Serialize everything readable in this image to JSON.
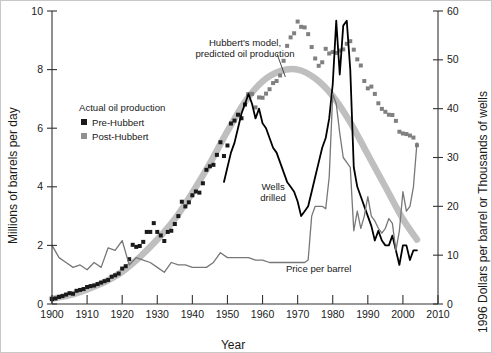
{
  "chart_data": {
    "type": "line",
    "title": "",
    "xlabel": "Year",
    "ylabel": "Millions of barrels per day",
    "y2label": "1996 Dollars per barrel or Thousands of wells",
    "xlim": [
      1900,
      2010
    ],
    "ylim": [
      0,
      10
    ],
    "y2lim": [
      0,
      60
    ],
    "xticks": [
      1900,
      1910,
      1920,
      1930,
      1940,
      1950,
      1960,
      1970,
      1980,
      1990,
      2000,
      2010
    ],
    "xticklabels": [
      "1900",
      "1910",
      "1920",
      "1930",
      "1940",
      "1950",
      "1960",
      "1970",
      "1980",
      "1990",
      "2000",
      "2010"
    ],
    "yticks": [
      0,
      2,
      4,
      6,
      8,
      10
    ],
    "yticklabels": [
      "0",
      "2",
      "4",
      "6",
      "8",
      "10"
    ],
    "y2ticks": [
      0,
      10,
      20,
      30,
      40,
      50,
      60
    ],
    "y2ticklabels": [
      "0",
      "10",
      "20",
      "30",
      "40",
      "50",
      "60"
    ],
    "grid": false,
    "legend_position": "upper-left-inside",
    "colors": {
      "pre_hubbert": "#1a1a1a",
      "post_hubbert": "#808080",
      "hubbert_model": "#bfbfbf",
      "wells_drilled": "#000000",
      "price_per_barrel": "#777777"
    },
    "annotations": [
      {
        "name": "hubbert-model-annotation",
        "text_line1": "Hubbert's model,",
        "text_line2": "predicted oil production",
        "x": 1955,
        "y": 8.8
      },
      {
        "name": "wells-drilled-annotation",
        "text_line1": "Wells",
        "text_line2": "drilled",
        "x": 1963,
        "y": 3.9
      },
      {
        "name": "price-per-barrel-annotation",
        "text_line1": "Price per barrel",
        "x": 1976,
        "y": 1.1
      }
    ],
    "series": [
      {
        "name": "Hubbert's model, predicted oil production",
        "key": "hubbert_model",
        "style": "thick-gray-curve",
        "axis": "left",
        "x": [
          1900,
          1905,
          1910,
          1915,
          1920,
          1925,
          1930,
          1935,
          1940,
          1945,
          1950,
          1955,
          1960,
          1965,
          1970,
          1975,
          1980,
          1985,
          1990,
          1995,
          2000,
          2004
        ],
        "values": [
          0.18,
          0.3,
          0.5,
          0.75,
          1.1,
          1.6,
          2.2,
          2.9,
          3.8,
          4.8,
          5.9,
          6.9,
          7.6,
          7.95,
          8.0,
          7.7,
          7.1,
          6.2,
          5.1,
          4.0,
          2.9,
          2.2
        ]
      },
      {
        "name": "Pre-Hubbert",
        "key": "pre_hubbert",
        "style": "black-squares",
        "axis": "left",
        "x": [
          1900,
          1901,
          1902,
          1903,
          1904,
          1905,
          1906,
          1907,
          1908,
          1909,
          1910,
          1911,
          1912,
          1913,
          1914,
          1915,
          1916,
          1917,
          1918,
          1919,
          1920,
          1921,
          1922,
          1923,
          1924,
          1925,
          1926,
          1927,
          1928,
          1929,
          1930,
          1931,
          1932,
          1933,
          1934,
          1935,
          1936,
          1937,
          1938,
          1939,
          1940,
          1941,
          1942,
          1943,
          1944,
          1945,
          1946,
          1947,
          1948,
          1949,
          1950,
          1951,
          1952,
          1953,
          1954,
          1955,
          1956
        ],
        "values": [
          0.17,
          0.19,
          0.24,
          0.27,
          0.32,
          0.37,
          0.35,
          0.45,
          0.48,
          0.51,
          0.58,
          0.61,
          0.63,
          0.68,
          0.73,
          0.78,
          0.82,
          0.93,
          0.98,
          1.04,
          1.21,
          1.29,
          1.53,
          2.02,
          1.95,
          1.98,
          2.12,
          2.46,
          2.46,
          2.76,
          2.46,
          2.34,
          2.15,
          2.46,
          2.5,
          2.73,
          3.0,
          3.49,
          3.33,
          3.47,
          3.71,
          3.84,
          3.8,
          4.12,
          4.58,
          4.7,
          4.75,
          5.09,
          5.52,
          5.05,
          5.41,
          6.16,
          6.26,
          6.46,
          6.34,
          6.81,
          7.15
        ]
      },
      {
        "name": "Post-Hubbert",
        "key": "post_hubbert",
        "style": "gray-squares",
        "axis": "left",
        "x": [
          1956,
          1957,
          1958,
          1959,
          1960,
          1961,
          1962,
          1963,
          1964,
          1965,
          1966,
          1967,
          1968,
          1969,
          1970,
          1971,
          1972,
          1973,
          1974,
          1975,
          1976,
          1977,
          1978,
          1979,
          1980,
          1981,
          1982,
          1983,
          1984,
          1985,
          1986,
          1987,
          1988,
          1989,
          1990,
          1991,
          1992,
          1993,
          1994,
          1995,
          1996,
          1997,
          1998,
          1999,
          2000,
          2001,
          2002,
          2003,
          2004
        ],
        "values": [
          7.15,
          7.17,
          6.71,
          7.05,
          7.04,
          7.18,
          7.33,
          7.54,
          7.61,
          7.8,
          8.3,
          8.81,
          9.1,
          9.24,
          9.64,
          9.46,
          9.44,
          9.21,
          8.77,
          8.38,
          8.13,
          8.25,
          8.71,
          8.55,
          8.6,
          8.57,
          8.65,
          8.69,
          8.88,
          8.97,
          8.68,
          8.35,
          8.14,
          7.61,
          7.36,
          7.42,
          7.17,
          6.85,
          6.66,
          6.56,
          6.46,
          6.45,
          6.25,
          5.88,
          5.82,
          5.8,
          5.75,
          5.68,
          5.42
        ]
      },
      {
        "name": "Wells drilled",
        "key": "wells_drilled",
        "style": "black-line",
        "axis": "right",
        "x": [
          1949,
          1950,
          1951,
          1952,
          1953,
          1954,
          1955,
          1956,
          1957,
          1958,
          1959,
          1960,
          1961,
          1962,
          1963,
          1964,
          1965,
          1966,
          1967,
          1968,
          1969,
          1970,
          1971,
          1972,
          1973,
          1974,
          1975,
          1976,
          1977,
          1978,
          1979,
          1980,
          1981,
          1982,
          1983,
          1984,
          1985,
          1986,
          1987,
          1988,
          1989,
          1990,
          1991,
          1992,
          1993,
          1994,
          1995,
          1996,
          1997,
          1998,
          1999,
          2000,
          2001,
          2002,
          2003,
          2004
        ],
        "values": [
          25,
          28,
          31,
          33,
          36,
          39,
          41,
          43,
          41,
          38,
          40,
          37,
          36,
          34,
          32,
          31,
          29,
          27,
          25,
          24,
          23,
          21,
          18,
          19,
          20,
          23,
          26,
          29,
          32,
          34,
          38,
          45,
          58,
          47,
          57,
          58,
          48,
          28,
          24,
          22,
          20,
          18,
          16,
          13,
          15,
          13,
          12,
          12,
          14,
          11,
          8,
          12,
          12,
          9,
          11,
          11
        ]
      },
      {
        "name": "Price per barrel",
        "key": "price_per_barrel",
        "style": "gray-thin-line",
        "axis": "right",
        "x": [
          1900,
          1902,
          1904,
          1906,
          1908,
          1910,
          1912,
          1914,
          1916,
          1918,
          1920,
          1922,
          1924,
          1926,
          1928,
          1930,
          1932,
          1934,
          1936,
          1938,
          1940,
          1942,
          1944,
          1946,
          1948,
          1950,
          1952,
          1954,
          1956,
          1958,
          1960,
          1962,
          1964,
          1966,
          1968,
          1970,
          1972,
          1973,
          1974,
          1975,
          1976,
          1977,
          1978,
          1979,
          1980,
          1981,
          1982,
          1983,
          1984,
          1985,
          1986,
          1987,
          1988,
          1989,
          1990,
          1991,
          1992,
          1993,
          1994,
          1995,
          1996,
          1997,
          1998,
          1999,
          2000,
          2001,
          2002,
          2003,
          2004
        ],
        "values": [
          12.0,
          9.5,
          8.5,
          7.5,
          8.0,
          7.0,
          8.5,
          7.5,
          11.5,
          11.0,
          13.0,
          8.0,
          9.5,
          9.0,
          8.5,
          7.5,
          6.5,
          8.5,
          8.0,
          8.0,
          7.5,
          7.5,
          7.5,
          8.5,
          10.5,
          9.5,
          9.5,
          9.5,
          9.5,
          9.0,
          9.0,
          8.5,
          8.5,
          8.5,
          8.5,
          8.5,
          8.5,
          9.0,
          18.0,
          20.0,
          20.0,
          20.0,
          19.5,
          26.0,
          43.0,
          41.0,
          35.0,
          30.0,
          29.0,
          28.0,
          15.0,
          19.0,
          15.5,
          18.0,
          22.0,
          18.0,
          17.0,
          15.5,
          14.5,
          15.5,
          17.5,
          16.5,
          11.0,
          15.0,
          23.0,
          19.0,
          20.0,
          24.0,
          33.0
        ]
      }
    ]
  },
  "legend": {
    "header": "Actual oil production",
    "items": [
      {
        "label": "Pre-Hubbert",
        "marker": "black-square"
      },
      {
        "label": "Post-Hubbert",
        "marker": "gray-square"
      }
    ]
  }
}
